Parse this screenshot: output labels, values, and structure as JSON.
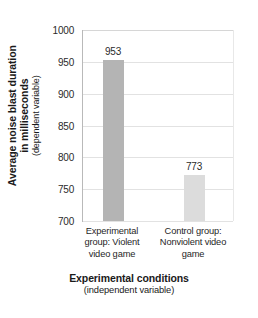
{
  "chart_data": {
    "type": "bar",
    "title": "",
    "categories": [
      "Experimental group: Violent video game",
      "Control group: Nonviolent video game"
    ],
    "values": [
      953,
      773
    ],
    "value_labels": [
      "953",
      "773"
    ],
    "xlabel": "Experimental conditions",
    "xlabel_sub": "(independent variable)",
    "ylabel": "Average noise blast duration in milliseconds",
    "ylabel_sub": "(dependent variable)",
    "ylim": [
      700,
      1000
    ],
    "yticks": [
      1000,
      950,
      900,
      850,
      800,
      750,
      700
    ],
    "ytick_labels": [
      "1000",
      "950",
      "900",
      "850",
      "800",
      "750",
      "700"
    ],
    "grid": true,
    "legend": false,
    "bar_colors": [
      "#b4b4b4",
      "#dcdcdc"
    ]
  },
  "axis": {
    "y_title_line1": "Average noise blast duration",
    "y_title_line2": "in milliseconds",
    "y_title_sub": "(dependent variable)",
    "x_title": "Experimental conditions",
    "x_title_sub": "(independent variable)"
  },
  "categories_wrapped": [
    [
      "Experimental",
      "group: Violent",
      "video game"
    ],
    [
      "Control group:",
      "Nonviolent video",
      "game"
    ]
  ],
  "colors": {
    "bar_experimental": "#b4b4b4",
    "bar_control": "#dcdcdc",
    "gridline": "#e2e2e2",
    "axis_line": "#b9b9b9",
    "text": "#1a1a1a",
    "background": "#ffffff"
  }
}
